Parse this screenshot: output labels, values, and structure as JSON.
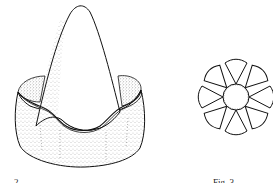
{
  "illustration": {
    "style": "pen-and-ink line drawing with stippling",
    "colors": {
      "background": "#ffffff",
      "ink": "#111111",
      "stipple": "#333333"
    },
    "figures": [
      {
        "id": "left",
        "description": "conical body seated in a cup with a wavy, upturned rim",
        "caption": "2"
      },
      {
        "id": "right",
        "description": "rosette of eight rounded lobes around a central disc",
        "lobe_count": 8,
        "caption": "Fig. 3"
      }
    ]
  }
}
